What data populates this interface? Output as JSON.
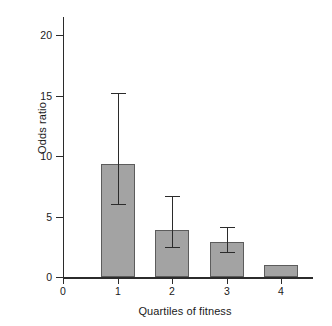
{
  "chart_data": {
    "type": "bar",
    "title": "",
    "xlabel": "Quartiles of fitness",
    "ylabel": "Odds ratio",
    "categories": [
      "1",
      "2",
      "3",
      "4"
    ],
    "values": [
      9.3,
      3.9,
      2.9,
      1.0
    ],
    "error_low": [
      6.0,
      2.5,
      2.1,
      null
    ],
    "error_high": [
      15.2,
      6.7,
      4.1,
      null
    ],
    "xlim": [
      0,
      4.6
    ],
    "ylim": [
      0,
      21.6
    ],
    "xticks": [
      "0",
      "1",
      "2",
      "3",
      "4"
    ],
    "yticks": [
      "0",
      "5",
      "10",
      "15",
      "20"
    ],
    "grid": false,
    "legend": "none",
    "bar_color": "#a3a3a3",
    "bar_edge_color": "#5c5c5c",
    "axis_color": "#2b2b2b",
    "error_bar_color": "#2b2b2b",
    "background": "#ffffff"
  }
}
